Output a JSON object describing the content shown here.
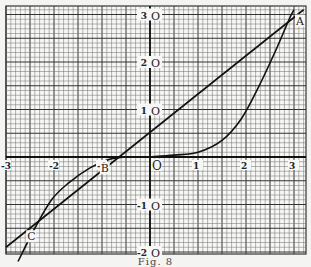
{
  "chart_data": {
    "type": "line",
    "title": "",
    "caption": "Fig. 8",
    "xlabel": "",
    "ylabel": "",
    "xlim": [
      -3,
      3
    ],
    "ylim": [
      -2,
      3
    ],
    "grid": true,
    "grid_minor_step": 0.1,
    "grid_major_step": 0.5,
    "x_ticks": [
      {
        "value": -3,
        "label": "-3"
      },
      {
        "value": -2,
        "label": "-2"
      },
      {
        "value": -1,
        "label": "-1"
      },
      {
        "value": 0,
        "label": "O"
      },
      {
        "value": 1,
        "label": "1"
      },
      {
        "value": 2,
        "label": "2"
      },
      {
        "value": 3,
        "label": "3"
      }
    ],
    "y_ticks": [
      {
        "value": 3,
        "label": "3 O"
      },
      {
        "value": 2,
        "label": "2 O"
      },
      {
        "value": 1,
        "label": "1 O"
      },
      {
        "value": -1,
        "label": "-1 O"
      },
      {
        "value": -2,
        "label": "-2 O"
      }
    ],
    "series": [
      {
        "name": "straight line",
        "kind": "line",
        "x": [
          -3.0,
          3.2
        ],
        "y": [
          -1.9,
          3.1
        ]
      },
      {
        "name": "curve right branch",
        "kind": "curve",
        "x": [
          0.0,
          0.5,
          1.0,
          1.5,
          1.9,
          2.25,
          2.6,
          2.9,
          3.0
        ],
        "y": [
          0.0,
          0.04,
          0.1,
          0.35,
          0.8,
          1.45,
          2.2,
          2.9,
          3.1
        ]
      },
      {
        "name": "curve left branch",
        "kind": "curve",
        "x": [
          -2.75,
          -2.4,
          -2.05,
          -1.7,
          -1.25,
          -0.85,
          -0.5
        ],
        "y": [
          -2.2,
          -1.5,
          -0.9,
          -0.55,
          -0.23,
          -0.05,
          0.0
        ]
      }
    ],
    "annotations": [
      {
        "label": "A",
        "x": 3.0,
        "y": 3.0
      },
      {
        "label": "B",
        "x": -0.9,
        "y": -0.05
      },
      {
        "label": "C",
        "x": -2.6,
        "y": -1.5
      }
    ]
  },
  "figure": {
    "caption": "Fig. 8"
  }
}
